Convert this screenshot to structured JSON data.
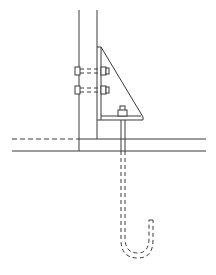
{
  "diagram": {
    "title": "Column base bracket with J-hook anchor bolt",
    "elements": [
      {
        "id": "column",
        "label": "Steel column"
      },
      {
        "id": "bracket",
        "label": "Triangular gusset bracket"
      },
      {
        "id": "side-bolts",
        "label": "Bolts through column (2)"
      },
      {
        "id": "anchor-bolt",
        "label": "J-hook anchor bolt"
      },
      {
        "id": "foundation",
        "label": "Foundation / slab lines"
      }
    ],
    "colors": {
      "line": "#3a3a3a",
      "background": "#ffffff"
    }
  }
}
